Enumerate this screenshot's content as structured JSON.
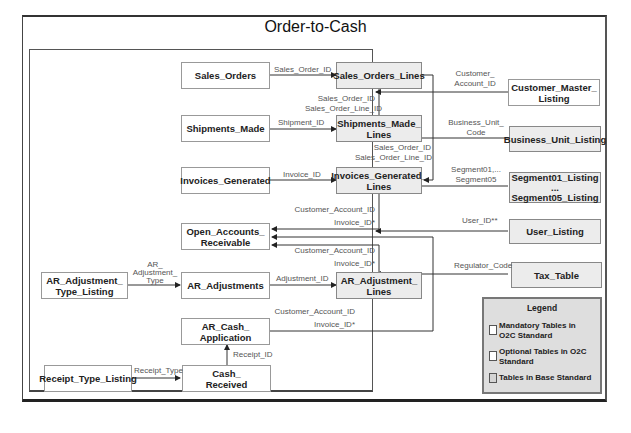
{
  "diagram": {
    "title": "Order-to-Cash",
    "colors": {
      "base_table_fill": "#ececec",
      "o2c_table_fill": "#ffffff",
      "legend_fill": "#dedede",
      "line": "#333333"
    },
    "tables": {
      "sales_orders": "Sales_Orders",
      "sales_orders_lines": "Sales_Orders_Lines",
      "shipments_made": "Shipments_Made",
      "shipments_made_lines_1": "Shipments_Made_",
      "shipments_made_lines_2": "Lines",
      "invoices_generated": "Invoices_Generated",
      "invoices_generated_lines_1": "Invoices_Generated_",
      "invoices_generated_lines_2": "Lines",
      "open_ar_1": "Open_Accounts_",
      "open_ar_2": "Receivable",
      "ar_adj_type_1": "AR_Adjustment_",
      "ar_adj_type_2": "Type_Listing",
      "ar_adjustments": "AR_Adjustments",
      "ar_adj_lines_1": "AR_Adjustment_",
      "ar_adj_lines_2": "Lines",
      "ar_cash_app_1": "AR_Cash_",
      "ar_cash_app_2": "Application",
      "receipt_type_listing": "Receipt_Type_Listing",
      "cash_received_1": "Cash_",
      "cash_received_2": "Received",
      "customer_master_1": "Customer_Master_",
      "customer_master_2": "Listing",
      "business_unit_listing": "Business_Unit_Listing",
      "segment_1": "Segment01_Listing",
      "segment_2": "...",
      "segment_3": "Segment05_Listing",
      "user_listing": "User_Listing",
      "tax_table": "Tax_Table"
    },
    "labels": {
      "sales_order_id": "Sales_Order_ID",
      "sol_1": "Sales_Order_ID",
      "sol_2": "Sales_Order_Line_ID",
      "shipment_id": "Shipment_ID",
      "sml_1": "Sales_Order_ID",
      "sml_2": "Sales_Order_Line_ID",
      "invoice_id": "Invoice_ID",
      "igl_1": "Customer_Account_ID",
      "igl_2": "Invoice_ID*",
      "adjl_1": "Customer_Account_ID",
      "adjl_2": "Invoice_ID*",
      "ar_adj_type_1": "AR_",
      "ar_adj_type_2": "Adjustment_",
      "ar_adj_type_3": "Type",
      "adjustment_id": "Adjustment_ID",
      "cash_1": "Customer_Account_ID",
      "cash_2": "Invoice_ID*",
      "receipt_id": "Receipt_ID",
      "receipt_type": "Receipt_Type",
      "cust_1": "Customer_",
      "cust_2": "Account_ID",
      "bu_1": "Business_Unit_",
      "bu_2": "Code",
      "seg_1": "Segment01,...",
      "seg_2": "Segment05",
      "user_id": "User_ID**",
      "regulator_code": "Regulator_Code"
    },
    "legend": {
      "title": "Legend",
      "items": [
        {
          "label_1": "Mandatory Tables in",
          "label_2": "O2C Standard",
          "fill": "#ffffff"
        },
        {
          "label_1": "Optional Tables in O2C",
          "label_2": "Standard",
          "fill": "#ffffff"
        },
        {
          "label_1": "Tables in Base Standard",
          "label_2": "",
          "fill": "#d4d4d4"
        }
      ]
    }
  }
}
